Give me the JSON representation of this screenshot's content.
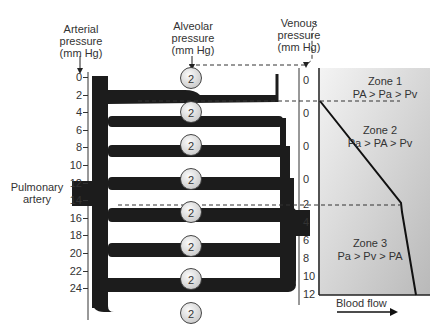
{
  "labels": {
    "arterial": [
      "Arterial",
      "pressure",
      "(mm Hg)"
    ],
    "alveolar": [
      "Alveolar",
      "pressure",
      "(mm Hg)"
    ],
    "venous": [
      "Venous",
      "pressure",
      "(mm Hg)"
    ],
    "pulmonary_artery": [
      "Pulmonary",
      "artery"
    ],
    "blood_flow": "Blood flow"
  },
  "arterial_ticks": [
    "0",
    "2",
    "4",
    "6",
    "8",
    "10",
    "12",
    "14",
    "16",
    "18",
    "20",
    "22",
    "24"
  ],
  "venous_ticks": [
    "0",
    "0",
    "0",
    "0",
    "2",
    "4",
    "6",
    "8",
    "10",
    "12"
  ],
  "alveolar_value": "2",
  "alveoli_count": 8,
  "zones": [
    {
      "title": "Zone 1",
      "relation": "PA > Pa > Pv"
    },
    {
      "title": "Zone 2",
      "relation": "Pa > PA > Pv"
    },
    {
      "title": "Zone 3",
      "relation": "Pa > Pv > PA"
    }
  ]
}
